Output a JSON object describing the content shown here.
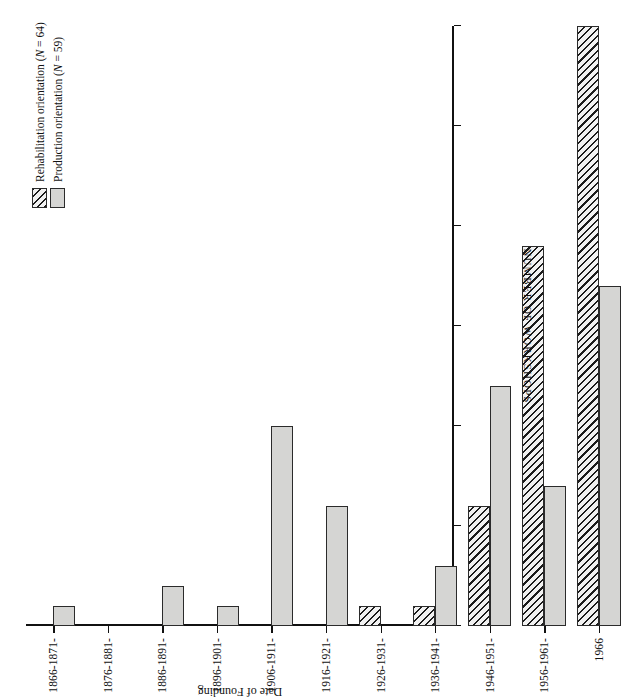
{
  "figure": {
    "orientation_note": "rotated-90-ccw-print",
    "value_axis_title": "NUMBER OF WORKSHOPS",
    "category_axis_title": "Date of Founding"
  },
  "legend": {
    "position": "bottom-right",
    "items": [
      {
        "key": "rehabilitation",
        "label": "Rehabilitation orientation (N = 64)",
        "pattern": "diagonal-hatch",
        "color": "#f2f2f2"
      },
      {
        "key": "production",
        "label": "Production orientation (N = 59)",
        "pattern": "solid",
        "color": "#d5d5d3"
      }
    ]
  },
  "chart_data": {
    "type": "bar",
    "title": "",
    "subtitle": "",
    "xlabel": "Date of Founding",
    "ylabel": "NUMBER OF WORKSHOPS",
    "ylim": [
      0,
      30
    ],
    "yticks": [
      0,
      5,
      10,
      15,
      20,
      25,
      30
    ],
    "grid": false,
    "orientation": "horizontal-grouped",
    "categories": [
      "1866-1871-",
      "1876-1881-",
      "1886-1891-",
      "1896-1901-",
      "1906-1911-",
      "1916-1921-",
      "1926-1931-",
      "1936-1941-",
      "1946-1951-",
      "1956-1961-",
      "1966"
    ],
    "series": [
      {
        "name": "Rehabilitation orientation (N = 64)",
        "color": "#f2f2f2",
        "pattern": "diagonal-hatch",
        "values": [
          0,
          0,
          0,
          0,
          0,
          0,
          1,
          1,
          6,
          19,
          30
        ]
      },
      {
        "name": "Production orientation (N = 59)",
        "color": "#d5d5d3",
        "pattern": "solid",
        "values": [
          1,
          0,
          2,
          1,
          10,
          6,
          0,
          3,
          12,
          7,
          17
        ]
      }
    ],
    "annotations": []
  }
}
